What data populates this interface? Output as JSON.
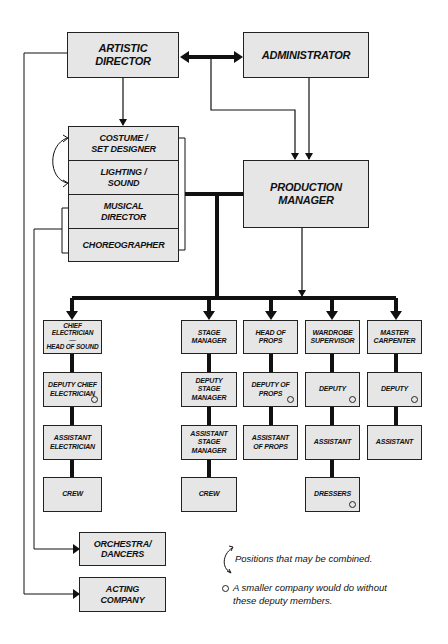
{
  "top": {
    "artistic_director": "Artistic\nDirector",
    "administrator": "Administrator",
    "production_manager": "Production\nManager"
  },
  "creative_stack": [
    "Costume /\nSet Designer",
    "Lighting /\nSound",
    "Musical\nDirector",
    "Choreographer"
  ],
  "departments": [
    {
      "head": "Chief\nElectrician\n—\nHead of Sound",
      "levels": [
        {
          "label": "Deputy Chief\nElectrician",
          "optional": true
        },
        {
          "label": "Assistant\nElectrician",
          "optional": false
        },
        {
          "label": "Crew",
          "optional": false
        }
      ]
    },
    {
      "head": "Stage\nManager",
      "levels": [
        {
          "label": "Deputy\nStage\nManager",
          "optional": false
        },
        {
          "label": "Assistant\nStage\nManager",
          "optional": false
        },
        {
          "label": "Crew",
          "optional": false
        }
      ]
    },
    {
      "head": "Head of\nProps",
      "levels": [
        {
          "label": "Deputy of\nProps",
          "optional": true
        },
        {
          "label": "Assistant\nof Props",
          "optional": false
        }
      ]
    },
    {
      "head": "Wardrobe\nSupervisor",
      "levels": [
        {
          "label": "Deputy",
          "optional": true
        },
        {
          "label": "Assistant",
          "optional": false
        },
        {
          "label": "Dressers",
          "optional": true
        }
      ]
    },
    {
      "head": "Master\nCarpenter",
      "levels": [
        {
          "label": "Deputy",
          "optional": true
        },
        {
          "label": "Assistant",
          "optional": false
        }
      ]
    }
  ],
  "performers": {
    "orchestra": "Orchestra/\nDancers",
    "acting": "Acting\nCompany"
  },
  "legend": {
    "combined": "Positions that may be combined.",
    "deputy": "A smaller company would do without these deputy members."
  },
  "colors": {
    "box_fill": "#e6e6e6",
    "line": "#111111"
  }
}
